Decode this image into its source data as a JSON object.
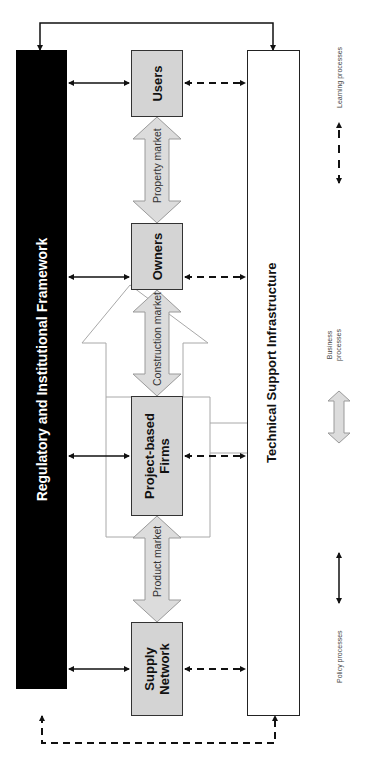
{
  "diagram": {
    "framework": {
      "label": "Regulatory and Institutional Framework"
    },
    "infrastructure": {
      "label": "Technical Support Infrastructure"
    },
    "actors": [
      {
        "id": "supply",
        "label": "Supply Network"
      },
      {
        "id": "firms",
        "label": "Project-based Firms"
      },
      {
        "id": "owners",
        "label": "Owners"
      },
      {
        "id": "users",
        "label": "Users"
      }
    ],
    "markets": [
      {
        "label": "Product market"
      },
      {
        "label": "Construction market"
      },
      {
        "label": "Property market"
      }
    ],
    "legend": [
      {
        "label": "Policy processes",
        "style": "solid-double-arrow"
      },
      {
        "label": "Business processes",
        "style": "block-double-arrow"
      },
      {
        "label": "Learning processes",
        "style": "dashed-double-arrow"
      }
    ],
    "colors": {
      "framework_fill": "#000000",
      "actor_fill": "#d4d4d4",
      "market_arrow_fill": "#dcdcdc",
      "outline_arrow_stroke": "#9a9a9a",
      "line": "#111111"
    },
    "rotation_deg": -90
  }
}
